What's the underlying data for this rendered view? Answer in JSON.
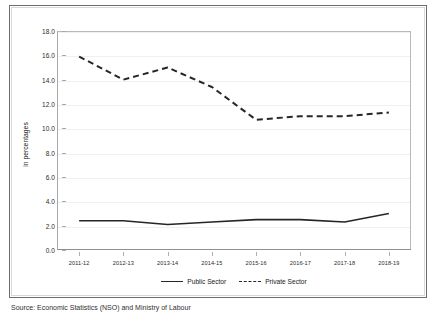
{
  "chart_data": {
    "type": "line",
    "title": "",
    "xlabel": "",
    "ylabel": "in percentages",
    "ylim": [
      0.0,
      18.0
    ],
    "ytick_step": 2.0,
    "yticks": [
      "18.0",
      "16.0",
      "14.0",
      "12.0",
      "10.0",
      "8.0",
      "6.0",
      "4.0",
      "2.0",
      "0.0"
    ],
    "grid": true,
    "legend_position": "bottom-center",
    "categories": [
      "2011-12",
      "2012-13",
      "2013-14",
      "2014-15",
      "2015-16",
      "2016-17",
      "2017-18",
      "2018-19"
    ],
    "series": [
      {
        "name": "Public Sector",
        "style": "solid",
        "color": "#262626",
        "values": [
          2.4,
          2.4,
          2.1,
          2.3,
          2.5,
          2.5,
          2.3,
          3.0
        ]
      },
      {
        "name": "Private Sector",
        "style": "dashed",
        "color": "#262626",
        "values": [
          15.9,
          14.0,
          15.0,
          13.4,
          10.7,
          11.0,
          11.0,
          11.3
        ]
      }
    ]
  },
  "axis": {
    "y_title": "in percentages"
  },
  "legend": {
    "items": [
      {
        "label": "Public Sector"
      },
      {
        "label": "Private Sector"
      }
    ]
  },
  "caption": {
    "text": "Source: Economic Statistics (NSO) and Ministry of Labour"
  }
}
